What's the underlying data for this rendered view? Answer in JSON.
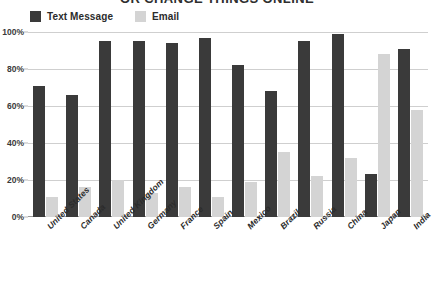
{
  "title": "OR CHANGE THINGS ONLINE",
  "legend": {
    "position": "top-left",
    "items": [
      {
        "label": "Text Message",
        "color": "#3a3a3a"
      },
      {
        "label": "Email",
        "color": "#d4d4d4"
      }
    ]
  },
  "axis": {
    "y_ticks": [
      "0%",
      "20%",
      "40%",
      "60%",
      "80%",
      "100%"
    ],
    "y_tick_values": [
      0,
      20,
      40,
      60,
      80,
      100
    ]
  },
  "chart_data": {
    "type": "bar",
    "title": "OR CHANGE THINGS ONLINE",
    "xlabel": "",
    "ylabel": "",
    "ylim": [
      0,
      100
    ],
    "grid": true,
    "legend_position": "top-left",
    "categories": [
      "United States",
      "Canada",
      "United Kingdom",
      "Germany",
      "France",
      "Spain",
      "Mexico",
      "Brazil",
      "Russia",
      "China",
      "Japan",
      "India"
    ],
    "series": [
      {
        "name": "Text Message",
        "color": "#3a3a3a",
        "values": [
          71,
          66,
          95,
          95,
          94,
          97,
          82,
          68,
          95,
          99,
          23,
          91
        ]
      },
      {
        "name": "Email",
        "color": "#d4d4d4",
        "values": [
          11,
          16,
          20,
          13,
          16,
          11,
          19,
          35,
          22,
          32,
          88,
          58
        ]
      }
    ],
    "tick_labels": {
      "y": [
        "0%",
        "20%",
        "40%",
        "60%",
        "80%",
        "100%"
      ]
    }
  }
}
